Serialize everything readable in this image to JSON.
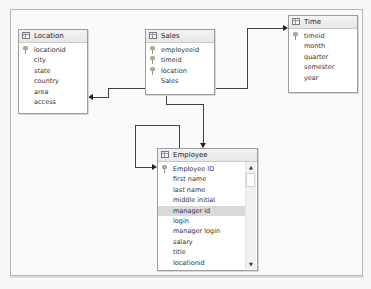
{
  "diagram": {
    "tables": {
      "location": {
        "title": "Location",
        "columns": [
          {
            "name": "locationid",
            "key": true
          },
          {
            "name": "city",
            "key": false
          },
          {
            "name": "state",
            "key": false
          },
          {
            "name": "country",
            "key": false
          },
          {
            "name": "area",
            "key": false
          },
          {
            "name": "access",
            "key": false
          }
        ]
      },
      "sales": {
        "title": "Sales",
        "columns": [
          {
            "name": "employeeid",
            "key": true
          },
          {
            "name": "timeid",
            "key": true
          },
          {
            "name": "location",
            "key": true
          },
          {
            "name": "Sales",
            "key": false
          }
        ]
      },
      "time": {
        "title": "Time",
        "columns": [
          {
            "name": "timeid",
            "key": true
          },
          {
            "name": "month",
            "key": false
          },
          {
            "name": "quarter",
            "key": false
          },
          {
            "name": "semester",
            "key": false
          },
          {
            "name": "year",
            "key": false
          }
        ]
      },
      "employee": {
        "title": "Employee",
        "selected_column": "manager id",
        "columns": [
          {
            "name": "Employee ID",
            "key": true
          },
          {
            "name": "first name",
            "key": false
          },
          {
            "name": "last name",
            "key": false
          },
          {
            "name": "middle initial",
            "key": false
          },
          {
            "name": "manager id",
            "key": false
          },
          {
            "name": "login",
            "key": false
          },
          {
            "name": "manager login",
            "key": false
          },
          {
            "name": "salary",
            "key": false
          },
          {
            "name": "title",
            "key": false
          },
          {
            "name": "locationid",
            "key": false
          }
        ],
        "scrollbar": {
          "up_icon": "▲",
          "down_icon": "▼"
        }
      }
    },
    "relationships": [
      {
        "from": "Sales",
        "to": "Location"
      },
      {
        "from": "Sales",
        "to": "Time"
      },
      {
        "from": "Sales",
        "to": "Employee"
      },
      {
        "from": "Employee",
        "to": "Employee"
      }
    ],
    "colors": {
      "line": "#404040",
      "selected_row": "#d9d9d9",
      "border": "#9c9c9c"
    }
  }
}
